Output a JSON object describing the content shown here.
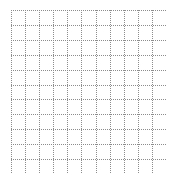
{
  "figure": {
    "background_color": "#ffffff",
    "width": 175,
    "height": 183
  },
  "chart_data": {
    "type": "table",
    "title": "",
    "subtitle": "",
    "xlabel": "",
    "ylabel": "",
    "grid": true,
    "grid_style": "dotted",
    "grid_color": "#8c8c8c",
    "grid_line_width": 1,
    "columns": 11,
    "rows": 11,
    "cell_width_px": 14.09,
    "cell_height_px": 14.91,
    "xlim": [
      0,
      11
    ],
    "ylim": [
      0,
      11
    ],
    "x_tick_values": [
      0,
      1,
      2,
      3,
      4,
      5,
      6,
      7,
      8,
      9,
      10,
      11
    ],
    "y_tick_values": [
      0,
      1,
      2,
      3,
      4,
      5,
      6,
      7,
      8,
      9,
      10,
      11
    ],
    "x_tick_labels": [
      "",
      "",
      "",
      "",
      "",
      "",
      "",
      "",
      "",
      "",
      "",
      ""
    ],
    "y_tick_labels": [
      "",
      "",
      "",
      "",
      "",
      "",
      "",
      "",
      "",
      "",
      "",
      ""
    ],
    "series": [],
    "legend": {
      "visible": false,
      "position": "none",
      "entries": []
    },
    "annotations": []
  },
  "plot_area": {
    "left_px": 11,
    "top_px": 10,
    "width_px": 155,
    "height_px": 164,
    "background_color": "#ffffff",
    "border_color": "#8c8c8c"
  },
  "top_tick_labels": [
    {
      "label": "—",
      "x_px": 44
    },
    {
      "label": "—",
      "x_px": 108
    },
    {
      "label": "—",
      "x_px": 134
    }
  ]
}
